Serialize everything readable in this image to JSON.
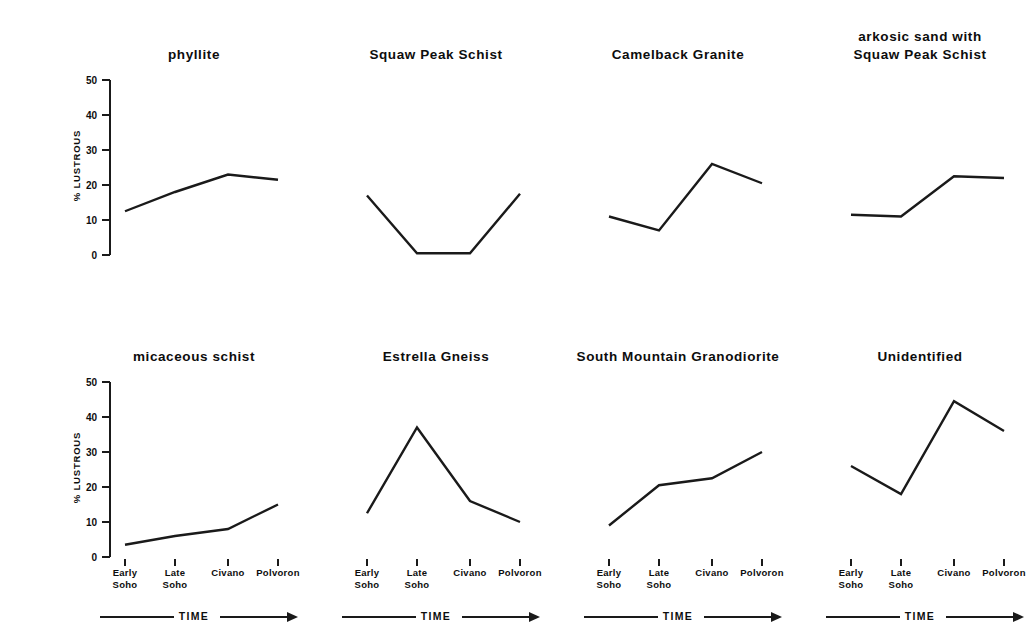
{
  "figure": {
    "y_axis_label": "% LUSTROUS",
    "y_ticks": [
      "0",
      "10",
      "20",
      "30",
      "40",
      "50"
    ],
    "x_tick_labels": [
      "Early\nSoho",
      "Late\nSoho",
      "Civano",
      "Polvoron"
    ],
    "time_axis_label": "TIME",
    "line_color": "#1a1a1a",
    "background_color": "#ffffff"
  },
  "chart_data": {
    "type": "line",
    "title": "",
    "xlabel": "TIME",
    "ylabel": "% LUSTROUS",
    "ylim": [
      0,
      50
    ],
    "yticks": [
      0,
      10,
      20,
      30,
      40,
      50
    ],
    "grid": false,
    "legend": "none",
    "categories": [
      "Early Soho",
      "Late Soho",
      "Civano",
      "Polvoron"
    ],
    "panels": [
      {
        "title": "phyllite",
        "row": 0,
        "col": 0,
        "values": [
          12.5,
          18.0,
          23.0,
          21.5
        ]
      },
      {
        "title": "Squaw Peak Schist",
        "row": 0,
        "col": 1,
        "values": [
          17.0,
          0.5,
          0.5,
          17.5
        ]
      },
      {
        "title": "Camelback Granite",
        "row": 0,
        "col": 2,
        "values": [
          11.0,
          7.0,
          26.0,
          20.5
        ]
      },
      {
        "title": "arkosic sand with\nSquaw Peak Schist",
        "row": 0,
        "col": 3,
        "values": [
          11.5,
          11.0,
          22.5,
          22.0
        ]
      },
      {
        "title": "micaceous schist",
        "row": 1,
        "col": 0,
        "values": [
          3.5,
          6.0,
          8.0,
          15.0
        ]
      },
      {
        "title": "Estrella Gneiss",
        "row": 1,
        "col": 1,
        "values": [
          12.5,
          37.0,
          16.0,
          10.0
        ]
      },
      {
        "title": "South Mountain Granodiorite",
        "row": 1,
        "col": 2,
        "values": [
          9.0,
          20.5,
          22.5,
          30.0
        ]
      },
      {
        "title": "Unidentified",
        "row": 1,
        "col": 3,
        "values": [
          26.0,
          18.0,
          44.5,
          36.0
        ]
      }
    ]
  }
}
